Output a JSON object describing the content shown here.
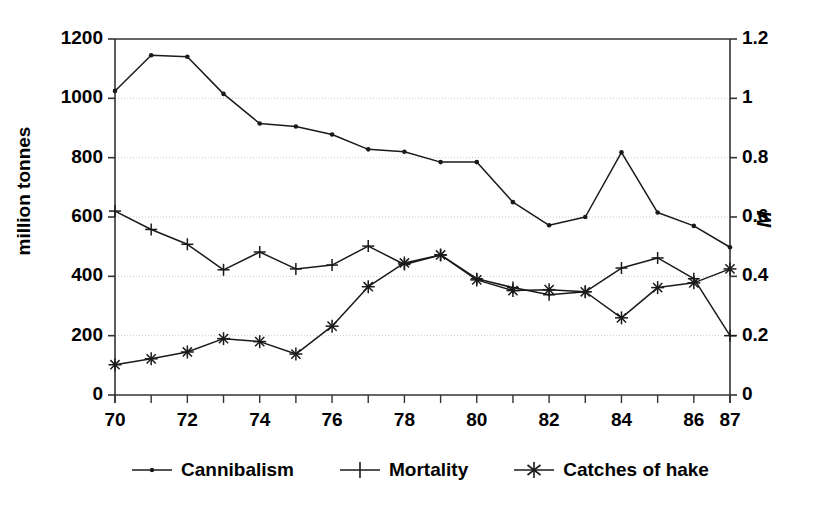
{
  "chart_data": {
    "type": "line",
    "title": "",
    "xlabel": "",
    "ylabel": "million tonnes",
    "y2label": "M",
    "x": [
      70,
      71,
      72,
      73,
      74,
      75,
      76,
      77,
      78,
      79,
      80,
      81,
      82,
      83,
      84,
      85,
      86,
      87
    ],
    "xtick_labels": [
      "70",
      "",
      "72",
      "",
      "74",
      "",
      "76",
      "",
      "78",
      "",
      "80",
      "",
      "82",
      "",
      "84",
      "",
      "86",
      "87"
    ],
    "xlim": [
      70,
      87
    ],
    "ylim": [
      0,
      1200
    ],
    "ytick_labels": [
      "0",
      "200",
      "400",
      "600",
      "800",
      "1000",
      "1200"
    ],
    "ytick_values": [
      0,
      200,
      400,
      600,
      800,
      1000,
      1200
    ],
    "y2lim": [
      0,
      1.2
    ],
    "y2tick_labels": [
      "0",
      "0.2",
      "0.4",
      "0.6",
      "0.8",
      "1",
      "1.2"
    ],
    "y2tick_values": [
      0,
      0.2,
      0.4,
      0.6,
      0.8,
      1.0,
      1.2
    ],
    "grid": "horizontal-dotted",
    "legend_position": "bottom-center",
    "series": [
      {
        "name": "Cannibalism",
        "marker": "dot",
        "axis": "left",
        "values": [
          1025,
          1145,
          1140,
          1015,
          915,
          905,
          878,
          828,
          820,
          785,
          785,
          650,
          572,
          600,
          818,
          615,
          570,
          498
        ]
      },
      {
        "name": "Mortality",
        "marker": "plus",
        "axis": "left",
        "values": [
          620,
          558,
          508,
          422,
          482,
          425,
          438,
          502,
          440,
          472,
          392,
          362,
          338,
          348,
          428,
          462,
          392,
          200
        ]
      },
      {
        "name": "Catches of hake",
        "marker": "asterisk",
        "axis": "left",
        "values": [
          102,
          122,
          145,
          190,
          180,
          138,
          232,
          365,
          445,
          472,
          388,
          352,
          355,
          348,
          260,
          362,
          378,
          425
        ]
      }
    ]
  },
  "legend": {
    "items": [
      {
        "label": "Cannibalism",
        "marker": "dot"
      },
      {
        "label": "Mortality",
        "marker": "plus"
      },
      {
        "label": "Catches of hake",
        "marker": "asterisk"
      }
    ]
  },
  "colors": {
    "line": "#1a1a1a",
    "axis": "#333333",
    "grid": "#c8c8c8",
    "background": "#ffffff"
  }
}
